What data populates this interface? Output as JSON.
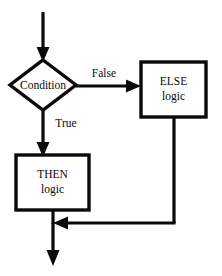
{
  "diagram": {
    "type": "flowchart",
    "canvas": {
      "width": 222,
      "height": 276,
      "background": "#ffffff"
    },
    "stroke_color": "#0a0a0a",
    "text_color": "#0a0a0a",
    "nodes": {
      "condition": {
        "shape": "diamond",
        "label": "Condition",
        "cx": 43,
        "cy": 85,
        "rx": 33,
        "ry": 25,
        "stroke_width": 3
      },
      "else_logic": {
        "shape": "rectangle",
        "label_line1": "ELSE",
        "label_line2": "logic",
        "x": 141,
        "y": 62,
        "width": 65,
        "height": 55,
        "stroke_width": 3
      },
      "then_logic": {
        "shape": "rectangle",
        "label_line1": "THEN",
        "label_line2": "logic",
        "x": 16,
        "y": 155,
        "width": 73,
        "height": 55,
        "stroke_width": 3
      }
    },
    "edges": {
      "entry": {
        "from": "start",
        "to": "condition",
        "label": "",
        "orientation": "vertical-down",
        "x": 43,
        "y_start": 12,
        "y_end": 60,
        "stroke_width": 3,
        "arrowhead": true
      },
      "false_branch": {
        "from": "condition",
        "to": "else_logic",
        "label": "False",
        "label_x": 104,
        "label_y": 74,
        "orientation": "horizontal-right",
        "y": 86,
        "x_start": 76,
        "x_end": 141,
        "stroke_width": 3,
        "arrowhead": true
      },
      "true_branch": {
        "from": "condition",
        "to": "then_logic",
        "label": "True",
        "label_x": 66,
        "label_y": 124,
        "orientation": "vertical-down",
        "x": 43,
        "y_start": 110,
        "y_end": 155,
        "stroke_width": 3,
        "arrowhead": true
      },
      "then_to_merge": {
        "from": "then_logic",
        "to": "merge",
        "label": "",
        "orientation": "vertical-down",
        "x": 53,
        "y_start": 210,
        "y_end": 223,
        "stroke_width": 3,
        "arrowhead": false
      },
      "else_return": {
        "from": "else_logic",
        "to": "merge",
        "label": "",
        "orientation": "down-then-left",
        "x_down": 174,
        "y_down_start": 117,
        "y_down_end": 223,
        "y_across": 223,
        "x_across_start": 174,
        "x_across_end": 53,
        "stroke_width": 3,
        "arrowhead": true
      },
      "exit": {
        "from": "merge",
        "to": "end",
        "label": "",
        "orientation": "vertical-down",
        "x": 53,
        "y_start": 223,
        "y_end": 266,
        "stroke_width": 3,
        "arrowhead": true
      }
    }
  }
}
